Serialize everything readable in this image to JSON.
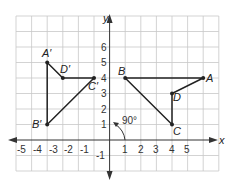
{
  "diagram": {
    "type": "coordinate-plane-rotation",
    "axes": {
      "x_label": "x",
      "y_label": "y",
      "x_ticks": [
        "-5",
        "-4",
        "-3",
        "-2",
        "-1",
        "1",
        "2",
        "3",
        "4",
        "5"
      ],
      "y_ticks": [
        "-1",
        "1",
        "2",
        "3",
        "4",
        "5",
        "6"
      ]
    },
    "rotation_label": "90°",
    "original": {
      "A": {
        "label": "A",
        "x": 6,
        "y": 4
      },
      "B": {
        "label": "B",
        "x": 1,
        "y": 4
      },
      "C": {
        "label": "C",
        "x": 4,
        "y": 1
      },
      "D": {
        "label": "D",
        "x": 4,
        "y": 3
      }
    },
    "image": {
      "A": {
        "label": "A′",
        "x": -4,
        "y": 5
      },
      "B": {
        "label": "B′",
        "x": -4,
        "y": 1
      },
      "C": {
        "label": "C′",
        "x": -1,
        "y": 4
      },
      "D": {
        "label": "D′",
        "x": -3,
        "y": 4
      }
    }
  }
}
